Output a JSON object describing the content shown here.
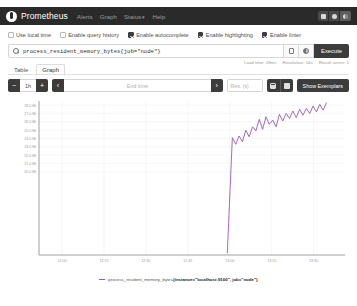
{
  "app": {
    "brand": "Prometheus"
  },
  "navbar": {
    "links": [
      {
        "label": "Alerts"
      },
      {
        "label": "Graph"
      },
      {
        "label": "Status",
        "caret": "▾"
      },
      {
        "label": "Help"
      }
    ],
    "theme_buttons": [
      "light-theme",
      "auto-theme",
      "dark-theme"
    ]
  },
  "options": [
    {
      "label": "Use local time",
      "checked": false
    },
    {
      "label": "Enable query history",
      "checked": false
    },
    {
      "label": "Enable autocomplete",
      "checked": true
    },
    {
      "label": "Enable highlighting",
      "checked": true
    },
    {
      "label": "Enable linter",
      "checked": true
    }
  ],
  "query": {
    "value": "process_resident_memory_bytes{job=\"node\"}",
    "placeholder": "Expression (press Shift+Enter for newlines)",
    "execute_label": "Execute"
  },
  "tabs": [
    {
      "label": "Table",
      "active": false
    },
    {
      "label": "Graph",
      "active": true
    }
  ],
  "stats": {
    "load_time": "Load time: 28ms",
    "resolution": "Resolution: 14s",
    "result_series": "Result series: 1"
  },
  "controls": {
    "minus": "−",
    "range": "1h",
    "plus": "+",
    "prev": "‹",
    "end_time_placeholder": "End time",
    "next": "›",
    "resolution_placeholder": "Res. (s)",
    "show_exemplars": "Show Exemplars"
  },
  "legend": {
    "metric": "process_resident_memory_bytes",
    "labels": "{instance=\"localhost:9100\", job=\"node\"}",
    "color": "#9b59b6"
  },
  "chart_data": {
    "type": "line",
    "title": "",
    "xlabel": "",
    "ylabel": "",
    "grid": true,
    "legend_position": "bottom",
    "ylim": [
      10000000,
      28500000
    ],
    "ytick_labels": [
      "28.0 Mi",
      "27.0 Mi",
      "26.0 Mi",
      "25.0 Mi",
      "24.0 Mi",
      "23.0 Mi",
      "22.0 Mi",
      "21.0 Mi",
      "20.0 Mi"
    ],
    "ytick_values": [
      28000000,
      27000000,
      26000000,
      25000000,
      24000000,
      23000000,
      22000000,
      21000000,
      20000000
    ],
    "xtick_labels": [
      "12:00",
      "12:15",
      "12:30",
      "12:45",
      "13:00",
      "13:15",
      "13:30"
    ],
    "series": [
      {
        "name": "process_resident_memory_bytes{instance=\"localhost:9100\", job=\"node\"}",
        "color": "#9b59b6",
        "x": [
          13.02,
          13.05,
          13.07,
          13.09,
          13.11,
          13.13,
          13.15,
          13.17,
          13.19,
          13.21,
          13.23,
          13.25,
          13.27,
          13.29,
          13.31,
          13.33,
          13.35,
          13.37,
          13.39,
          13.41,
          13.43,
          13.45,
          13.47,
          13.49,
          13.51,
          13.53,
          13.55,
          13.57,
          13.59,
          13.61
        ],
        "values": [
          10200000,
          24100000,
          23300000,
          24300000,
          23600000,
          25000000,
          24200000,
          25400000,
          24900000,
          26300000,
          25100000,
          26600000,
          25700000,
          26200000,
          25400000,
          26900000,
          26100000,
          27000000,
          26400000,
          27300000,
          26500000,
          27500000,
          26800000,
          27600000,
          27000000,
          27900000,
          27200000,
          28100000,
          27400000,
          28300000
        ]
      }
    ]
  }
}
